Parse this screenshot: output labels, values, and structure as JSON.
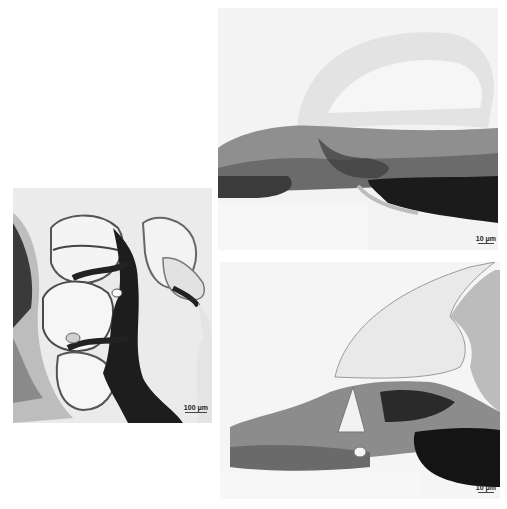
{
  "figure": {
    "panels": [
      {
        "id": "left",
        "description": "Low-magnification cochlear cross-section with stained modiolus and turns",
        "scale_bar": "100 μm"
      },
      {
        "id": "top-right",
        "description": "High-magnification view of organ of Corti region with tectorial membrane",
        "scale_bar": "10 μm"
      },
      {
        "id": "bottom-right",
        "description": "High-magnification view of organ of Corti with tunnel and tectorial membrane",
        "scale_bar": "10 μm"
      }
    ]
  },
  "colors": {
    "background": "#ffffff",
    "panel_bg": "#efefef",
    "tissue_dark": "#1e1e1e",
    "tissue_mid": "#7a7a7a",
    "tissue_light": "#cfcfcf"
  }
}
